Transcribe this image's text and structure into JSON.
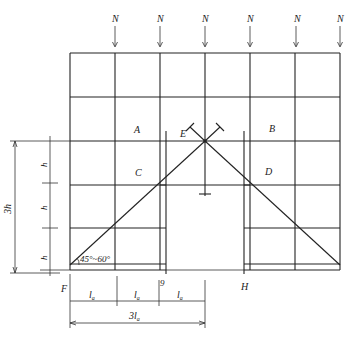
{
  "diagram": {
    "type": "scaffold-opening-structural-diagram",
    "load_labels": [
      "N",
      "N",
      "N",
      "N",
      "N",
      "N"
    ],
    "region_labels": {
      "A": "A",
      "B": "B",
      "C": "C",
      "D": "D",
      "E": "E"
    },
    "point_labels": {
      "F": "F",
      "H": "H",
      "G": "9"
    },
    "angle_label": "45°~60°",
    "vertical_dimension": {
      "total": "3h",
      "segments": [
        "h",
        "h",
        "h"
      ]
    },
    "horizontal_dimension": {
      "total": "3l",
      "total_subscript": "a",
      "segments": [
        {
          "base": "l",
          "sub": "a"
        },
        {
          "base": "l",
          "sub": "a"
        },
        {
          "base": "l",
          "sub": "a"
        }
      ]
    },
    "line_color": "#222222",
    "background": "#ffffff"
  }
}
